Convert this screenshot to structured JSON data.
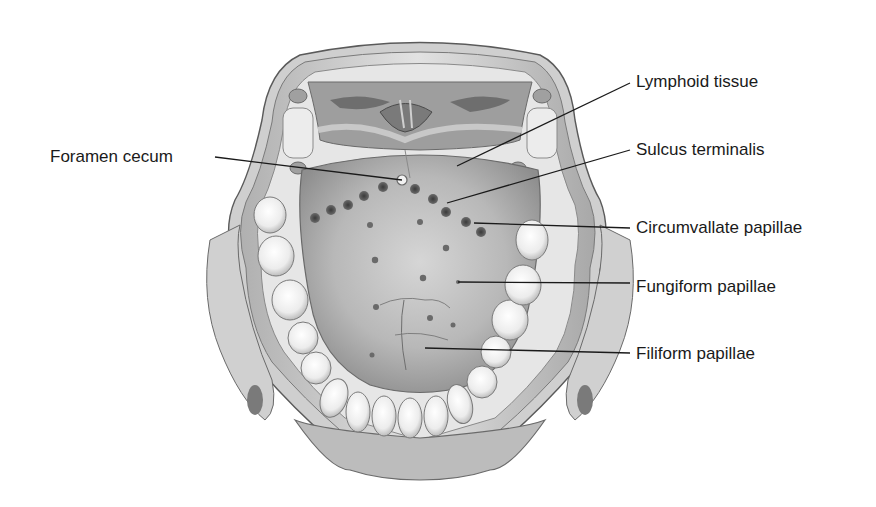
{
  "figure": {
    "colors": {
      "background": "#ffffff",
      "label_text": "#1a1a1a",
      "leader_line": "#1a1a1a",
      "tissue_dark": "#8a8a8a",
      "tissue_mid": "#b4b4b4",
      "tissue_light": "#d8d8d8",
      "tooth": "#f4f4f4",
      "papilla": "#4a4a4a"
    }
  },
  "labels": [
    {
      "id": "foramen-cecum",
      "text": "Foramen cecum",
      "side": "left",
      "x": 50,
      "y": 147,
      "line": {
        "x1": 215,
        "y1": 157,
        "x2": 402,
        "y2": 180
      }
    },
    {
      "id": "lymphoid-tissue",
      "text": "Lymphoid tissue",
      "side": "right",
      "x": 636,
      "y": 72,
      "line": {
        "x1": 630,
        "y1": 83,
        "x2": 457,
        "y2": 166
      }
    },
    {
      "id": "sulcus-terminalis",
      "text": "Sulcus terminalis",
      "side": "right",
      "x": 636,
      "y": 140,
      "line": {
        "x1": 630,
        "y1": 150,
        "x2": 447,
        "y2": 203
      }
    },
    {
      "id": "circumvallate-papillae",
      "text": "Circumvallate papillae",
      "side": "right",
      "x": 636,
      "y": 218,
      "line": {
        "x1": 630,
        "y1": 228,
        "x2": 474,
        "y2": 223
      }
    },
    {
      "id": "fungiform-papillae",
      "text": "Fungiform papillae",
      "side": "right",
      "x": 636,
      "y": 277,
      "line": {
        "x1": 630,
        "y1": 283,
        "x2": 458,
        "y2": 282
      }
    },
    {
      "id": "filiform-papillae",
      "text": "Filiform papillae",
      "side": "right",
      "x": 636,
      "y": 344,
      "line": {
        "x1": 630,
        "y1": 353,
        "x2": 425,
        "y2": 348
      }
    }
  ]
}
